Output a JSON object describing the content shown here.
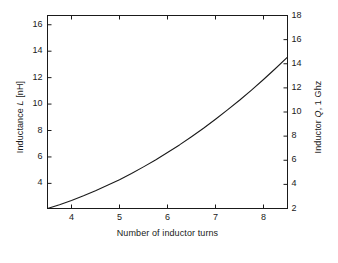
{
  "chart_data": {
    "type": "line",
    "title": "",
    "xlabel": "Number of inductor turns",
    "ylabel": "Inductance L [nH]",
    "ylabel_right": "Inductor Q, 1 Ghz",
    "xlim": [
      3.5,
      8.5
    ],
    "ylim": [
      2.1,
      16.7
    ],
    "ylim_right": [
      2,
      18
    ],
    "xticks": [
      4,
      5,
      6,
      7,
      8
    ],
    "xticklabels": [
      "4",
      "5",
      "6",
      "7",
      "8"
    ],
    "yticks": [
      4,
      6,
      8,
      10,
      12,
      14,
      16
    ],
    "yticklabels": [
      "4",
      "6",
      "8",
      "10",
      "12",
      "14",
      "16"
    ],
    "yticks_right": [
      2,
      4,
      6,
      8,
      10,
      12,
      14,
      16,
      18
    ],
    "yticklabels_right": [
      "2",
      "4",
      "6",
      "8",
      "10",
      "12",
      "14",
      "16",
      "18"
    ],
    "grid": false,
    "legend": null,
    "line_color": "#1a1a1a",
    "line_width": 1.1,
    "series": [
      {
        "name": "Inductance L",
        "x": [
          3.5,
          3.75,
          4.0,
          4.25,
          4.5,
          4.75,
          5.0,
          5.25,
          5.5,
          5.75,
          6.0,
          6.25,
          6.5,
          6.75,
          7.0,
          7.25,
          7.5,
          7.75,
          8.0,
          8.25,
          8.5
        ],
        "values": [
          2.1,
          2.39,
          2.71,
          3.06,
          3.44,
          3.85,
          4.28,
          4.75,
          5.25,
          5.77,
          6.33,
          6.91,
          7.53,
          8.17,
          8.85,
          9.56,
          10.29,
          11.06,
          11.86,
          12.69,
          13.55
        ]
      }
    ]
  },
  "axes": {
    "left_label_prefix": "Inductance ",
    "left_label_italic": "L",
    "left_label_suffix": " [nH]",
    "right_label_prefix": "Inductor ",
    "right_label_italic": "Q",
    "right_label_suffix": ", 1 Ghz",
    "x_label": "Number of inductor turns"
  }
}
